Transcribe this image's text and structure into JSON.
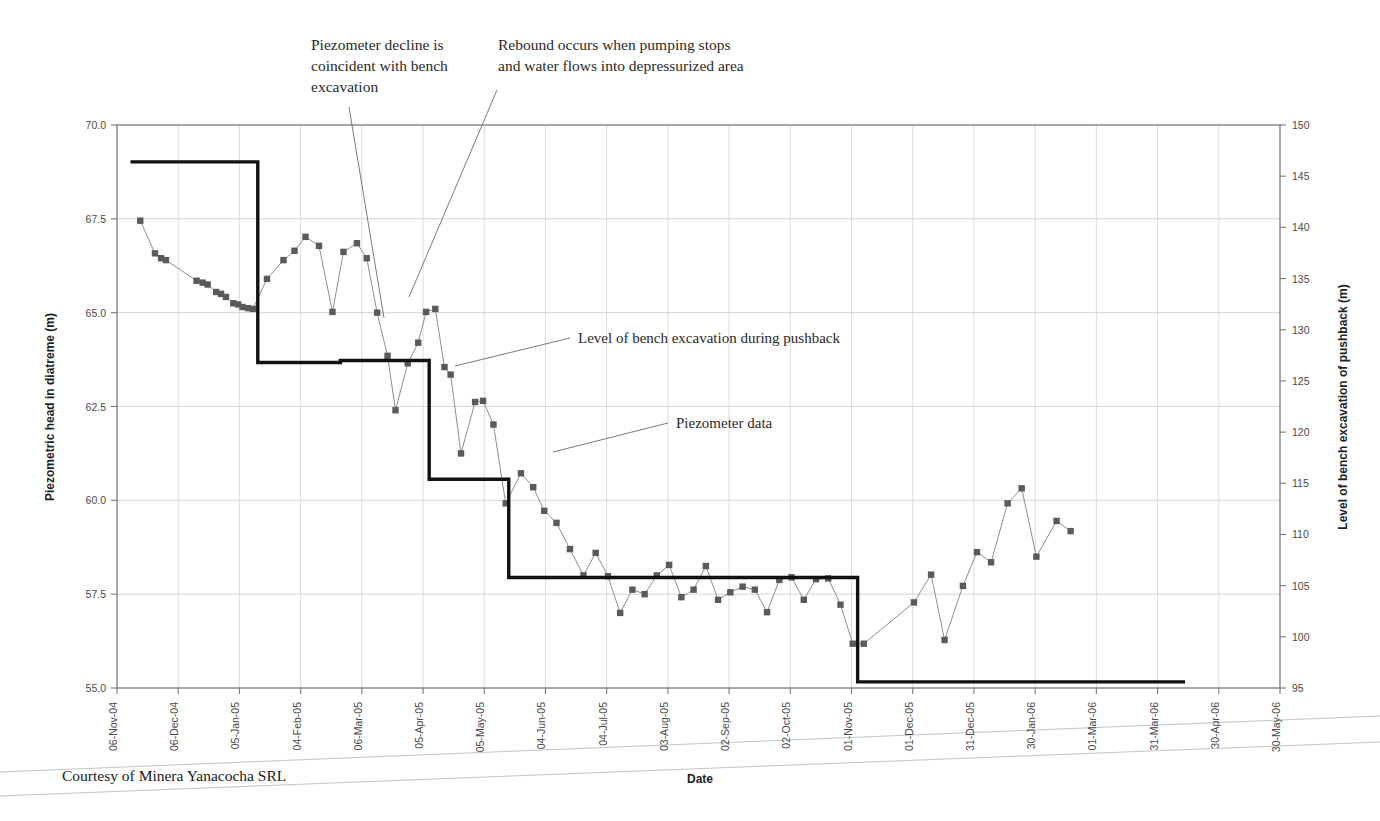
{
  "figure": {
    "caption": "Courtesy of Minera Yanacocha SRL",
    "xaxis_title": "Date",
    "yaxis_left_title": "Piezometric head in diatreme (m)",
    "yaxis_right_title": "Level of bench excavation of pushback (m)"
  },
  "annotations": {
    "callout_left": [
      "Piezometer decline is",
      "coincident with bench",
      "excavation"
    ],
    "callout_right": [
      "Rebound occurs when pumping stops",
      "and water flows into depressurized area"
    ],
    "bench_label": "Level of bench excavation during pushback",
    "piezo_label": "Piezometer data"
  },
  "chart_data": {
    "type": "line",
    "title": "",
    "xlabel": "Date",
    "ylabel": "Piezometric head in diatreme (m)",
    "y2label": "Level of bench excavation of pushback (m)",
    "grid": true,
    "legend": "inline-annotations",
    "ylim": [
      55.0,
      70.0
    ],
    "y2lim": [
      95,
      150
    ],
    "yticks": [
      "55.0",
      "57.5",
      "60.0",
      "62.5",
      "65.0",
      "67.5",
      "70.0"
    ],
    "y2ticks": [
      "95",
      "100",
      "105",
      "110",
      "115",
      "120",
      "125",
      "130",
      "135",
      "140",
      "145",
      "150"
    ],
    "xlim": [
      "06-Nov-04",
      "30-May-06"
    ],
    "xticks": [
      "06-Nov-04",
      "06-Dec-04",
      "05-Jan-05",
      "04-Feb-05",
      "06-Mar-05",
      "05-Apr-05",
      "05-May-05",
      "04-Jun-05",
      "04-Jul-05",
      "03-Aug-05",
      "02-Sep-05",
      "02-Oct-05",
      "01-Nov-05",
      "01-Dec-05",
      "31-Dec-05",
      "30-Jan-06",
      "01-Mar-06",
      "31-Mar-06",
      "30-Apr-06",
      "30-May-06"
    ],
    "series": [
      {
        "name": "Piezometer data",
        "axis": "left",
        "style": "line-with-square-markers",
        "points": [
          {
            "t": 0.38,
            "y": 67.45
          },
          {
            "t": 0.62,
            "y": 66.58
          },
          {
            "t": 0.72,
            "y": 66.45
          },
          {
            "t": 0.8,
            "y": 66.4
          },
          {
            "t": 1.3,
            "y": 65.85
          },
          {
            "t": 1.4,
            "y": 65.8
          },
          {
            "t": 1.48,
            "y": 65.75
          },
          {
            "t": 1.62,
            "y": 65.55
          },
          {
            "t": 1.7,
            "y": 65.5
          },
          {
            "t": 1.78,
            "y": 65.42
          },
          {
            "t": 1.9,
            "y": 65.25
          },
          {
            "t": 1.98,
            "y": 65.22
          },
          {
            "t": 2.05,
            "y": 65.15
          },
          {
            "t": 2.14,
            "y": 65.12
          },
          {
            "t": 2.22,
            "y": 65.1
          },
          {
            "t": 2.45,
            "y": 65.9
          },
          {
            "t": 2.72,
            "y": 66.4
          },
          {
            "t": 2.9,
            "y": 66.65
          },
          {
            "t": 3.08,
            "y": 67.02
          },
          {
            "t": 3.3,
            "y": 66.78
          },
          {
            "t": 3.52,
            "y": 65.02
          },
          {
            "t": 3.7,
            "y": 66.62
          },
          {
            "t": 3.92,
            "y": 66.85
          },
          {
            "t": 4.08,
            "y": 66.45
          },
          {
            "t": 4.25,
            "y": 65.0
          },
          {
            "t": 4.42,
            "y": 63.85
          },
          {
            "t": 4.55,
            "y": 62.4
          },
          {
            "t": 4.75,
            "y": 63.65
          },
          {
            "t": 4.92,
            "y": 64.2
          },
          {
            "t": 5.05,
            "y": 65.02
          },
          {
            "t": 5.2,
            "y": 65.1
          },
          {
            "t": 5.35,
            "y": 63.55
          },
          {
            "t": 5.45,
            "y": 63.35
          },
          {
            "t": 5.62,
            "y": 61.25
          },
          {
            "t": 5.85,
            "y": 62.62
          },
          {
            "t": 5.98,
            "y": 62.65
          },
          {
            "t": 6.15,
            "y": 62.02
          },
          {
            "t": 6.35,
            "y": 59.92
          },
          {
            "t": 6.6,
            "y": 60.72
          },
          {
            "t": 6.8,
            "y": 60.35
          },
          {
            "t": 6.98,
            "y": 59.72
          },
          {
            "t": 7.18,
            "y": 59.4
          },
          {
            "t": 7.4,
            "y": 58.7
          },
          {
            "t": 7.62,
            "y": 58.0
          },
          {
            "t": 7.82,
            "y": 58.6
          },
          {
            "t": 8.02,
            "y": 57.98
          },
          {
            "t": 8.22,
            "y": 57.0
          },
          {
            "t": 8.42,
            "y": 57.62
          },
          {
            "t": 8.62,
            "y": 57.5
          },
          {
            "t": 8.82,
            "y": 58.0
          },
          {
            "t": 9.02,
            "y": 58.28
          },
          {
            "t": 9.22,
            "y": 57.42
          },
          {
            "t": 9.42,
            "y": 57.62
          },
          {
            "t": 9.62,
            "y": 58.25
          },
          {
            "t": 9.82,
            "y": 57.35
          },
          {
            "t": 10.02,
            "y": 57.55
          },
          {
            "t": 10.22,
            "y": 57.7
          },
          {
            "t": 10.42,
            "y": 57.62
          },
          {
            "t": 10.62,
            "y": 57.02
          },
          {
            "t": 10.82,
            "y": 57.88
          },
          {
            "t": 11.02,
            "y": 57.95
          },
          {
            "t": 11.22,
            "y": 57.35
          },
          {
            "t": 11.42,
            "y": 57.9
          },
          {
            "t": 11.62,
            "y": 57.92
          },
          {
            "t": 11.82,
            "y": 57.22
          },
          {
            "t": 12.02,
            "y": 56.18
          },
          {
            "t": 12.2,
            "y": 56.18
          },
          {
            "t": 13.02,
            "y": 57.28
          },
          {
            "t": 13.3,
            "y": 58.02
          },
          {
            "t": 13.52,
            "y": 56.28
          },
          {
            "t": 13.82,
            "y": 57.72
          },
          {
            "t": 14.05,
            "y": 58.62
          },
          {
            "t": 14.28,
            "y": 58.35
          },
          {
            "t": 14.55,
            "y": 59.92
          },
          {
            "t": 14.78,
            "y": 60.32
          },
          {
            "t": 15.02,
            "y": 58.5
          },
          {
            "t": 15.35,
            "y": 59.45
          },
          {
            "t": 15.58,
            "y": 59.18
          }
        ]
      },
      {
        "name": "Level of bench excavation during pushback",
        "axis": "right",
        "style": "thick-step",
        "steps": [
          {
            "t_start": 0.22,
            "t_end": 2.3,
            "y": 146.4
          },
          {
            "t_start": 2.3,
            "t_end": 3.65,
            "y": 126.8
          },
          {
            "t_start": 3.65,
            "t_end": 5.1,
            "y": 127.0
          },
          {
            "t_start": 5.1,
            "t_end": 6.4,
            "y": 115.4
          },
          {
            "t_start": 6.4,
            "t_end": 12.1,
            "y": 105.8
          },
          {
            "t_start": 12.1,
            "t_end": 17.45,
            "y": 95.6
          }
        ]
      }
    ]
  }
}
